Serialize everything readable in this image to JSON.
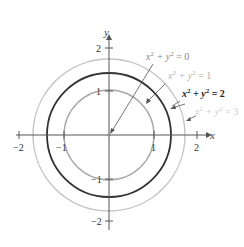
{
  "diagram": {
    "axes": {
      "x_label": "x",
      "y_label": "y",
      "x_ticks": [
        {
          "value": -2,
          "label": "−2"
        },
        {
          "value": -1,
          "label": "−1"
        },
        {
          "value": 1,
          "label": "1"
        },
        {
          "value": 2,
          "label": "2"
        }
      ],
      "y_ticks": [
        {
          "value": 2,
          "label": "2"
        },
        {
          "value": 1,
          "label": "1"
        },
        {
          "value": -1,
          "label": "−1"
        },
        {
          "value": -2,
          "label": "−2"
        }
      ]
    },
    "level_curves": [
      {
        "equation_base": "x",
        "equation_mid": " + y",
        "equation_end": " = 0",
        "c": 0,
        "radius": 0,
        "color": "#8a8a8a",
        "bold": false
      },
      {
        "equation_base": "x",
        "equation_mid": " + y",
        "equation_end": " = 1",
        "c": 1,
        "radius": 1,
        "color": "#a8a8a8",
        "bold": false
      },
      {
        "equation_base": "x",
        "equation_mid": " + y",
        "equation_end": " = 2",
        "c": 2,
        "radius": 1.414,
        "color": "#333333",
        "bold": true
      },
      {
        "equation_base": "x",
        "equation_mid": " + y",
        "equation_end": " = 3",
        "c": 3,
        "radius": 1.732,
        "color": "#c4c4c4",
        "bold": false
      }
    ],
    "superscript": "2"
  }
}
